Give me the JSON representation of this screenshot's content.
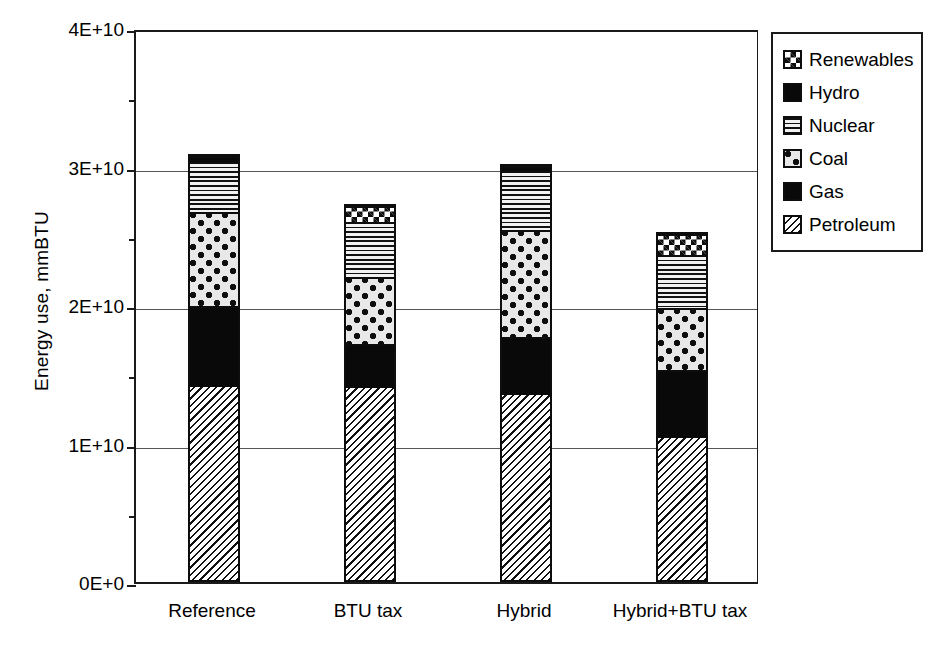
{
  "chart_data": {
    "type": "bar",
    "subtype": "stacked-bar",
    "title": "",
    "xlabel": "",
    "ylabel": "Energy use, mmBTU",
    "categories": [
      "Reference",
      "BTU tax",
      "Hybrid",
      "Hybrid+BTU tax"
    ],
    "ylim": [
      0,
      40000000000
    ],
    "ytick_values": [
      0,
      10000000000,
      20000000000,
      30000000000,
      40000000000
    ],
    "ytick_labels": [
      "0E+0",
      "1E+10",
      "2E+10",
      "3E+10",
      "4E+10"
    ],
    "yminor_tick_values": [
      5000000000,
      15000000000,
      25000000000,
      35000000000
    ],
    "grid": true,
    "grid_axis": "y",
    "legend_position": "right",
    "stack_order_bottom_to_top": [
      "Petroleum",
      "Gas",
      "Coal",
      "Nuclear",
      "Hydro",
      "Renewables"
    ],
    "series": [
      {
        "name": "Petroleum",
        "pattern": "diagonal-hatch",
        "values": [
          14100000000,
          14000000000,
          13500000000,
          10400000000
        ]
      },
      {
        "name": "Gas",
        "pattern": "solid-black",
        "values": [
          5800000000,
          3200000000,
          4200000000,
          4900000000
        ]
      },
      {
        "name": "Coal",
        "pattern": "dotted-circles",
        "values": [
          6800000000,
          4800000000,
          7700000000,
          4500000000
        ]
      },
      {
        "name": "Nuclear",
        "pattern": "horizontal-lines",
        "values": [
          3600000000,
          4000000000,
          4300000000,
          3800000000
        ]
      },
      {
        "name": "Hydro",
        "pattern": "solid-black",
        "values": [
          600000000,
          0,
          500000000,
          0
        ]
      },
      {
        "name": "Renewables",
        "pattern": "checkerboard",
        "values": [
          0,
          1300000000,
          0,
          1700000000
        ]
      }
    ],
    "totals": [
      30900000000,
      27300000000,
      30200000000,
      25300000000
    ],
    "total_labels": [
      "3.09E+10",
      "2.73E+10",
      "3.02E+10",
      "2.53E+10"
    ]
  },
  "legend": {
    "items": [
      {
        "label": "Renewables",
        "pattern": "checkerboard"
      },
      {
        "label": "Hydro",
        "pattern": "solid-black"
      },
      {
        "label": "Nuclear",
        "pattern": "horizontal-lines"
      },
      {
        "label": "Coal",
        "pattern": "dotted-circles"
      },
      {
        "label": "Gas",
        "pattern": "solid-black"
      },
      {
        "label": "Petroleum",
        "pattern": "diagonal-hatch"
      }
    ]
  },
  "colors": {
    "axis": "#1a1a1a",
    "gridline": "#555555",
    "background": "#ffffff",
    "ink": "#0d0d0d"
  }
}
